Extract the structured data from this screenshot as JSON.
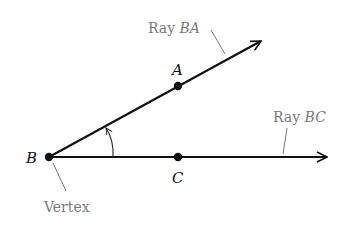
{
  "diagram": {
    "type": "angle",
    "points": {
      "B": {
        "label": "B",
        "x": 49,
        "y": 157
      },
      "A": {
        "label": "A",
        "x": 178,
        "y": 86
      },
      "C": {
        "label": "C",
        "x": 178,
        "y": 157
      }
    },
    "rays": [
      {
        "id": "BA",
        "from": "B",
        "through": "A",
        "end": {
          "x": 262,
          "y": 41
        }
      },
      {
        "id": "BC",
        "from": "B",
        "through": "C",
        "end": {
          "x": 328,
          "y": 157
        }
      }
    ],
    "callouts": {
      "ray_ba": {
        "prefix": "Ray ",
        "name": "BA"
      },
      "ray_bc": {
        "prefix": "Ray ",
        "name": "BC"
      },
      "vertex": {
        "text": "Vertex"
      }
    },
    "colors": {
      "line": "#111111",
      "callout_text": "#7a7a7a",
      "leader": "#777777"
    }
  }
}
